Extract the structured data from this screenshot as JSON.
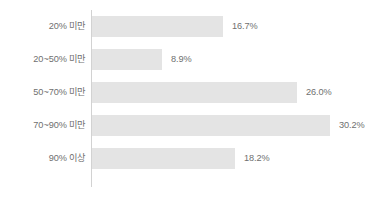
{
  "chart_data": {
    "type": "bar",
    "orientation": "horizontal",
    "title": "",
    "subtitle": "",
    "xlabel": "",
    "ylabel": "",
    "grid": false,
    "legend": false,
    "legend_position": "none",
    "axis_visible": "category-axis-only",
    "xlim": [
      0,
      35
    ],
    "unit": "%",
    "categories": [
      "20% 미만",
      "20~50% 미만",
      "50~70% 미만",
      "70~90% 미만",
      "90% 이상"
    ],
    "values": [
      16.7,
      8.9,
      26.0,
      30.2,
      18.2
    ],
    "data_labels": [
      "16.7%",
      "8.9%",
      "26.0%",
      "30.2%",
      "18.2%"
    ],
    "series": [
      {
        "name": "",
        "values": [
          16.7,
          8.9,
          26.0,
          30.2,
          18.2
        ]
      }
    ],
    "colors": {
      "bar_fill": "#e4e4e4",
      "axis_line": "#d2d2d2",
      "label_text": "#6f6f6f",
      "value_text": "#6f6f6f",
      "background": "#ffffff"
    }
  }
}
